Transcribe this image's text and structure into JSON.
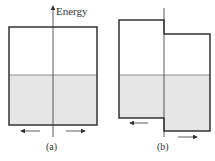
{
  "axis_label": "Energy",
  "panels": [
    {
      "id": "a",
      "label": "(a)",
      "arrows": [
        "left",
        "right"
      ]
    },
    {
      "id": "b",
      "label": "(b)",
      "arrows": [
        "left",
        "right"
      ]
    }
  ],
  "colors": {
    "stroke": "#333333",
    "fill": "#e6e6e6",
    "background": "#ffffff"
  }
}
